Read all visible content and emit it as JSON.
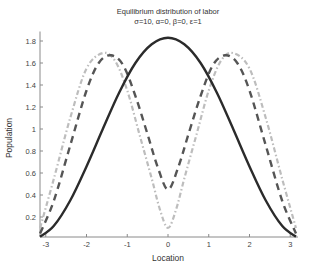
{
  "chart_data": {
    "type": "line",
    "title": "Equilibrium distribution of labor",
    "subtitle": "σ=10, α=0, β=0, ε=1",
    "xlabel": "Location",
    "ylabel": "Population",
    "xlim": [
      -3.1416,
      3.1416
    ],
    "ylim": [
      0,
      1.85
    ],
    "xticks": [
      -3,
      -2,
      -1,
      0,
      1,
      2,
      3
    ],
    "yticks": [
      0.2,
      0.4,
      0.6,
      0.8,
      1,
      1.2,
      1.4,
      1.6,
      1.8
    ],
    "ytick_labels": [
      "0.2",
      "0.4",
      "0.6",
      "0.8",
      "1",
      "1.2",
      "1.4",
      "1.6",
      "1.8"
    ],
    "grid": false,
    "legend": null,
    "series": [
      {
        "name": "solid",
        "style": "solid",
        "color": "#2b2b2b",
        "width": 2.4,
        "x": [
          -3.14,
          -2.8,
          -2.4,
          -2.0,
          -1.6,
          -1.2,
          -0.8,
          -0.4,
          0,
          0.4,
          0.8,
          1.2,
          1.6,
          2.0,
          2.4,
          2.8,
          3.14
        ],
        "y": [
          0.02,
          0.12,
          0.35,
          0.66,
          1.0,
          1.33,
          1.6,
          1.77,
          1.83,
          1.77,
          1.6,
          1.33,
          1.0,
          0.66,
          0.35,
          0.12,
          0.02
        ]
      },
      {
        "name": "dark-dashed",
        "style": "dashed",
        "color": "#555555",
        "width": 2.4,
        "x": [
          -3.14,
          -2.8,
          -2.4,
          -2.0,
          -1.7,
          -1.4,
          -1.1,
          -0.8,
          -0.5,
          -0.25,
          0,
          0.25,
          0.5,
          0.8,
          1.1,
          1.4,
          1.7,
          2.0,
          2.4,
          2.8,
          3.14
        ],
        "y": [
          0.05,
          0.35,
          0.85,
          1.35,
          1.6,
          1.67,
          1.58,
          1.3,
          0.95,
          0.65,
          0.45,
          0.65,
          0.95,
          1.3,
          1.58,
          1.67,
          1.6,
          1.35,
          0.85,
          0.35,
          0.05
        ]
      },
      {
        "name": "light-dashed",
        "style": "dash-dot",
        "color": "#bdbdbd",
        "width": 2.2,
        "x": [
          -3.14,
          -2.8,
          -2.4,
          -2.0,
          -1.6,
          -1.3,
          -1.0,
          -0.7,
          -0.4,
          -0.2,
          0,
          0.2,
          0.4,
          0.7,
          1.0,
          1.3,
          1.6,
          2.0,
          2.4,
          2.8,
          3.14
        ],
        "y": [
          0.1,
          0.55,
          1.1,
          1.55,
          1.69,
          1.62,
          1.35,
          0.95,
          0.55,
          0.27,
          0.1,
          0.27,
          0.55,
          0.95,
          1.35,
          1.62,
          1.69,
          1.55,
          1.1,
          0.55,
          0.1
        ]
      }
    ]
  }
}
